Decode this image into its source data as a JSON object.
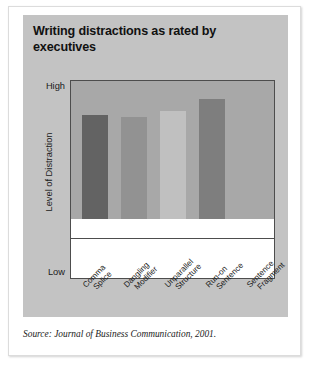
{
  "figure": {
    "title": "Writing distractions as rated by executives",
    "source_caption": "Source: Journal of Business Communication, 2001.",
    "panel_color": "#c3c3c3",
    "plot_background": "#ffffff",
    "axis_color": "#4d4d4d"
  },
  "chart_data": {
    "type": "bar",
    "title": "Writing distractions as rated by executives",
    "xlabel": "",
    "ylabel": "Level of Distraction",
    "ylim": [
      0,
      100
    ],
    "ytick_labels": [
      "High",
      "Low"
    ],
    "grid": true,
    "gridline_count": 4,
    "legend": "none",
    "categories": [
      "Comma Splice",
      "Dangling Modifier",
      "Unparallel Structure",
      "Run-on Sentence",
      "Sentence Fragment"
    ],
    "category_lines": [
      [
        "Comma",
        "Splice"
      ],
      [
        "Dangling",
        "Modifier"
      ],
      [
        "Unparallel",
        "Structure"
      ],
      [
        "Run-on",
        "Sentence"
      ],
      [
        "Sentence",
        "Fragment"
      ]
    ],
    "values": [
      70,
      75,
      74,
      78,
      87
    ],
    "bar_colors": [
      "#a8a8a8",
      "#636363",
      "#929292",
      "#c0c0c0",
      "#7e7e7e"
    ]
  }
}
